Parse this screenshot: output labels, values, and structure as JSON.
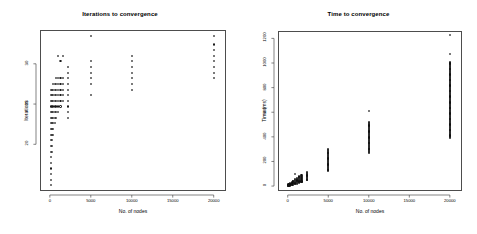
{
  "figure": {
    "background": "#ffffff",
    "point_color": "#1a1a1a",
    "frame_color": "#4d4d4d",
    "panels": 2
  },
  "chart_data": [
    {
      "type": "scatter",
      "title": "Iterations to convergence",
      "xlabel": "No. of nodes",
      "ylabel": "Iterations",
      "xlim": [
        -1200,
        21500
      ],
      "ylim": [
        14.2,
        34.2
      ],
      "xticks": [
        0,
        5000,
        10000,
        15000,
        20000
      ],
      "xticklabels": [
        "0",
        "5000",
        "10000",
        "15000",
        "20000"
      ],
      "yticks": [
        20,
        25,
        30
      ],
      "yticklabels": [
        "20",
        "25",
        "30"
      ],
      "grid": false,
      "legend": null,
      "marker": "open-circle",
      "points": [
        [
          100,
          15.0
        ],
        [
          100,
          15.6
        ],
        [
          100,
          16.3
        ],
        [
          100,
          17.0
        ],
        [
          100,
          17.7
        ],
        [
          100,
          18.4
        ],
        [
          100,
          19.1
        ],
        [
          100,
          19.8
        ],
        [
          100,
          20.5
        ],
        [
          100,
          21.2
        ],
        [
          100,
          21.9
        ],
        [
          100,
          22.6
        ],
        [
          100,
          23.3
        ],
        [
          100,
          24.0
        ],
        [
          100,
          24.7
        ],
        [
          100,
          25.4
        ],
        [
          100,
          26.1
        ],
        [
          100,
          26.8
        ],
        [
          250,
          19.1
        ],
        [
          250,
          19.8
        ],
        [
          250,
          20.5
        ],
        [
          250,
          21.2
        ],
        [
          250,
          21.9
        ],
        [
          250,
          22.6
        ],
        [
          250,
          23.3
        ],
        [
          250,
          24.0
        ],
        [
          250,
          24.7
        ],
        [
          250,
          25.4
        ],
        [
          250,
          26.1
        ],
        [
          250,
          26.8
        ],
        [
          400,
          21.2
        ],
        [
          400,
          21.9
        ],
        [
          400,
          22.6
        ],
        [
          400,
          23.3
        ],
        [
          400,
          24.0
        ],
        [
          400,
          24.7
        ],
        [
          400,
          25.4
        ],
        [
          400,
          26.1
        ],
        [
          400,
          26.8
        ],
        [
          400,
          27.5
        ],
        [
          600,
          22.6
        ],
        [
          600,
          23.3
        ],
        [
          600,
          24.0
        ],
        [
          600,
          24.7
        ],
        [
          600,
          25.4
        ],
        [
          600,
          26.1
        ],
        [
          600,
          26.8
        ],
        [
          600,
          27.5
        ],
        [
          800,
          23.3
        ],
        [
          800,
          24.0
        ],
        [
          800,
          24.7
        ],
        [
          800,
          25.4
        ],
        [
          800,
          26.1
        ],
        [
          800,
          26.8
        ],
        [
          800,
          27.5
        ],
        [
          800,
          28.2
        ],
        [
          1000,
          24.0
        ],
        [
          1000,
          24.7
        ],
        [
          1000,
          25.4
        ],
        [
          1000,
          26.1
        ],
        [
          1000,
          26.8
        ],
        [
          1000,
          27.5
        ],
        [
          1000,
          28.2
        ],
        [
          1000,
          31.0
        ],
        [
          1300,
          24.7
        ],
        [
          1300,
          25.4
        ],
        [
          1300,
          26.1
        ],
        [
          1300,
          26.8
        ],
        [
          1300,
          27.5
        ],
        [
          1300,
          28.2
        ],
        [
          1300,
          30.3
        ],
        [
          1600,
          25.4
        ],
        [
          1600,
          26.1
        ],
        [
          1600,
          26.8
        ],
        [
          1600,
          27.5
        ],
        [
          1600,
          28.2
        ],
        [
          1600,
          31.0
        ],
        [
          2200,
          23.3
        ],
        [
          2200,
          24.0
        ],
        [
          2200,
          24.7
        ],
        [
          2200,
          25.4
        ],
        [
          2200,
          26.1
        ],
        [
          2200,
          26.8
        ],
        [
          2200,
          27.5
        ],
        [
          2200,
          28.2
        ],
        [
          2200,
          28.9
        ],
        [
          2200,
          29.6
        ],
        [
          5000,
          26.1
        ],
        [
          5000,
          27.5
        ],
        [
          5000,
          28.2
        ],
        [
          5000,
          28.9
        ],
        [
          5000,
          29.6
        ],
        [
          5000,
          30.3
        ],
        [
          5000,
          33.5
        ],
        [
          10000,
          26.8
        ],
        [
          10000,
          27.5
        ],
        [
          10000,
          28.2
        ],
        [
          10000,
          28.9
        ],
        [
          10000,
          29.6
        ],
        [
          10000,
          30.3
        ],
        [
          10000,
          31.0
        ],
        [
          20000,
          28.2
        ],
        [
          20000,
          28.9
        ],
        [
          20000,
          29.6
        ],
        [
          20000,
          30.3
        ],
        [
          20000,
          31.0
        ],
        [
          20000,
          31.7
        ],
        [
          20000,
          32.4
        ],
        [
          20000,
          33.5
        ]
      ]
    },
    {
      "type": "scatter",
      "title": "Time to convergence",
      "xlabel": "No. of nodes",
      "ylabel": "Time (ms)",
      "xlim": [
        -1200,
        21500
      ],
      "ylim": [
        -40,
        1260
      ],
      "xticks": [
        0,
        5000,
        10000,
        15000,
        20000
      ],
      "xticklabels": [
        "0",
        "5000",
        "10000",
        "15000",
        "20000"
      ],
      "yticks": [
        0,
        200,
        400,
        600,
        800,
        1000,
        1200
      ],
      "yticklabels": [
        "0",
        "200",
        "400",
        "600",
        "800",
        "1000",
        "1200"
      ],
      "grid": false,
      "legend": null,
      "marker": "open-circle",
      "clusters": [
        {
          "x": 100,
          "ymin": 2,
          "ymax": 14
        },
        {
          "x": 300,
          "ymin": 4,
          "ymax": 22
        },
        {
          "x": 500,
          "ymin": 6,
          "ymax": 32
        },
        {
          "x": 700,
          "ymin": 10,
          "ymax": 44
        },
        {
          "x": 900,
          "ymin": 14,
          "ymax": 56
        },
        {
          "x": 1100,
          "ymin": 18,
          "ymax": 66
        },
        {
          "x": 1400,
          "ymin": 24,
          "ymax": 78
        },
        {
          "x": 1700,
          "ymin": 30,
          "ymax": 88
        },
        {
          "x": 2400,
          "ymin": 46,
          "ymax": 112
        },
        {
          "x": 5000,
          "ymin": 120,
          "ymax": 300
        },
        {
          "x": 10000,
          "ymin": 270,
          "ymax": 520
        },
        {
          "x": 20000,
          "ymin": 390,
          "ymax": 1010
        }
      ],
      "outliers": [
        [
          900,
          96
        ],
        [
          10000,
          612
        ],
        [
          20000,
          1072
        ],
        [
          20000,
          1228
        ]
      ]
    }
  ]
}
